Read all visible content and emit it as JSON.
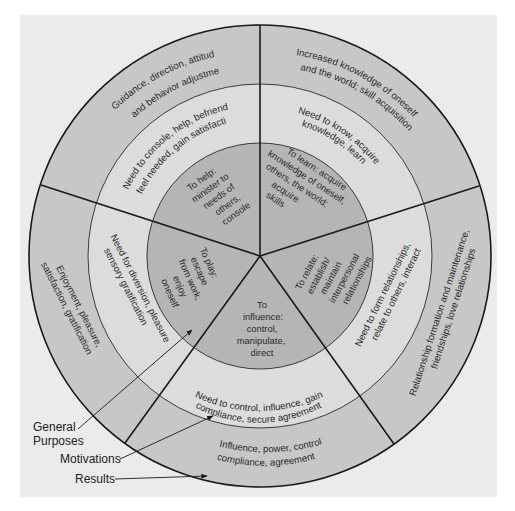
{
  "diagram": {
    "rings": {
      "inner_name": "General Purposes",
      "middle_name": "Motivations",
      "outer_name": "Results"
    },
    "colors": {
      "page": "#ffffff",
      "panel": "#ebebeb",
      "outer_ring": "#c7c7c7",
      "middle_ring": "#dcdcdc",
      "inner_disc": "#b5b5b5",
      "lines": "#1a1a1a"
    },
    "segments": [
      {
        "id": "help",
        "purpose": [
          "To help:",
          "minister to",
          "needs of",
          "others,",
          "console"
        ],
        "motivation": [
          "Need to console, help, befriend,",
          "feel needed, gain satisfaction"
        ],
        "result": [
          "Guidance, direction, attitude",
          "and behavior adjustment"
        ]
      },
      {
        "id": "learn",
        "purpose": [
          "To learn: acquire",
          "knowledge of oneself,",
          "others, the world;",
          "acquire",
          "skills"
        ],
        "motivation": [
          "Need to know, acquire",
          "knowledge, learn"
        ],
        "result": [
          "Increased knowledge of oneself",
          "and the world; skill acquisition"
        ]
      },
      {
        "id": "relate",
        "purpose": [
          "To relate:",
          "establish/",
          "maintain",
          "interpersonal",
          "relationships"
        ],
        "motivation": [
          "Need to form relationships,",
          "relate to others, interact"
        ],
        "result": [
          "Relationship formation and maintenance,",
          "friendships, love relationships"
        ]
      },
      {
        "id": "influence",
        "purpose": [
          "To",
          "influence:",
          "control,",
          "manipulate,",
          "direct"
        ],
        "motivation": [
          "Need to control, influence, gain",
          "compliance, secure agreement"
        ],
        "result": [
          "Influence, power, control",
          "compliance, agreement"
        ]
      },
      {
        "id": "play",
        "purpose": [
          "To play:",
          "escape",
          "from work,",
          "enjoy",
          "oneself"
        ],
        "motivation": [
          "Need for diversion, pleasure",
          "sensory gratification"
        ],
        "result": [
          "Enjoyment, pleasure,",
          "satisfaction, gratification"
        ]
      }
    ],
    "callouts": {
      "general_purposes": [
        "General",
        "Purposes"
      ],
      "motivations": "Motivations",
      "results": "Results"
    }
  }
}
